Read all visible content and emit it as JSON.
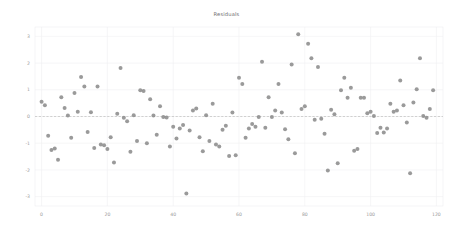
{
  "chart_data": {
    "type": "scatter",
    "title": "Residuals",
    "xlabel": "",
    "ylabel": "",
    "xlim": [
      -2,
      122
    ],
    "ylim": [
      -3.35,
      3.35
    ],
    "xticks": [
      0,
      20,
      40,
      60,
      80,
      100,
      120
    ],
    "yticks": [
      -3,
      -2,
      -1,
      0,
      1,
      2,
      3
    ],
    "xtick_labels": [
      "0",
      "20",
      "40",
      "60",
      "80",
      "100",
      "120"
    ],
    "ytick_labels": [
      "-3",
      "-2",
      "-1",
      "0",
      "1",
      "2",
      "3"
    ],
    "grid": true,
    "legend": null,
    "marker": "circle",
    "marker_color": "#8c8c8c",
    "marker_size": 2.0,
    "reference_line": {
      "name": "zero-line",
      "y": 0,
      "style": "dashed",
      "color": "#b0b0b0"
    },
    "series": [
      {
        "name": "residuals",
        "x": [
          0,
          1,
          2,
          3,
          4,
          5,
          6,
          7,
          8,
          9,
          10,
          11,
          12,
          13,
          14,
          15,
          16,
          17,
          18,
          19,
          20,
          21,
          22,
          23,
          24,
          25,
          26,
          27,
          28,
          29,
          30,
          31,
          32,
          33,
          34,
          35,
          36,
          37,
          38,
          39,
          40,
          41,
          42,
          43,
          44,
          45,
          46,
          47,
          48,
          49,
          50,
          51,
          52,
          53,
          54,
          55,
          56,
          57,
          58,
          59,
          60,
          61,
          62,
          63,
          64,
          65,
          66,
          67,
          68,
          69,
          70,
          71,
          72,
          73,
          74,
          75,
          76,
          77,
          78,
          79,
          80,
          81,
          82,
          83,
          84,
          85,
          86,
          87,
          88,
          89,
          90,
          91,
          92,
          93,
          94,
          95,
          96,
          97,
          98,
          99,
          100,
          101,
          102,
          103,
          104,
          105,
          106,
          107,
          108,
          109,
          110,
          111,
          112,
          113,
          114,
          115,
          116,
          117,
          118,
          119
        ],
        "y": [
          0.55,
          0.42,
          -0.72,
          -1.25,
          -1.2,
          -1.62,
          0.72,
          0.32,
          0.04,
          -0.8,
          0.88,
          0.18,
          1.48,
          1.12,
          -0.58,
          0.16,
          -1.18,
          1.12,
          -1.05,
          -1.08,
          -1.22,
          -0.78,
          -1.72,
          0.1,
          1.82,
          -0.05,
          -0.18,
          -1.32,
          0.05,
          -0.92,
          0.98,
          0.95,
          -1.0,
          0.65,
          0.04,
          -0.68,
          0.38,
          -0.02,
          -0.04,
          -1.12,
          -0.38,
          -0.82,
          -0.45,
          -0.32,
          -2.88,
          -0.52,
          0.22,
          0.3,
          -0.78,
          -1.3,
          0.05,
          -0.92,
          0.48,
          -1.05,
          -1.12,
          -0.5,
          -0.35,
          -1.48,
          0.15,
          -1.45,
          1.45,
          1.22,
          -0.8,
          -0.45,
          -0.28,
          -0.38,
          -0.02,
          2.05,
          -0.42,
          0.72,
          -0.02,
          0.22,
          1.22,
          0.15,
          -0.48,
          -0.85,
          1.95,
          -1.38,
          3.08,
          0.28,
          0.38,
          2.72,
          2.18,
          -0.12,
          1.85,
          -0.08,
          -0.65,
          -2.02,
          0.25,
          0.08,
          -1.75,
          0.98,
          1.45,
          0.7,
          1.08,
          -1.28,
          -1.22,
          0.7,
          0.7,
          0.12,
          0.18,
          0.02,
          -0.62,
          -0.42,
          -0.6,
          -0.45,
          0.48,
          0.18,
          0.22,
          1.35,
          0.42,
          -0.22,
          -2.12,
          0.52,
          1.02,
          2.18,
          0.02,
          -0.05,
          0.28,
          0.98
        ]
      }
    ]
  }
}
